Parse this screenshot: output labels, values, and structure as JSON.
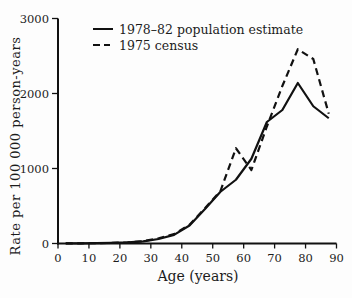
{
  "chart_data": {
    "type": "line",
    "title": "",
    "xlabel": "Age (years)",
    "ylabel": "Rate per 100 000 person-years",
    "xlim": [
      0,
      90
    ],
    "ylim": [
      0,
      3000
    ],
    "x_ticks": [
      0,
      10,
      20,
      30,
      40,
      50,
      60,
      70,
      80,
      90
    ],
    "y_ticks": [
      0,
      1000,
      2000,
      3000
    ],
    "grid": false,
    "legend_position": "top-left-inside",
    "line_color": "#111111",
    "x": [
      2.5,
      7.5,
      12.5,
      17.5,
      22.5,
      27.5,
      32.5,
      37.5,
      42.5,
      47.5,
      52.5,
      57.5,
      62.5,
      67.5,
      72.5,
      77.5,
      82.5,
      87.5
    ],
    "series": [
      {
        "name": "1978–82 population estimate",
        "style": "solid",
        "values": [
          3,
          3,
          4,
          8,
          14,
          28,
          60,
          115,
          240,
          460,
          690,
          850,
          1130,
          1620,
          1780,
          2140,
          1830,
          1670
        ]
      },
      {
        "name": "1975 census",
        "style": "dashed",
        "values": [
          3,
          3,
          4,
          8,
          14,
          30,
          70,
          125,
          250,
          470,
          700,
          1270,
          980,
          1560,
          2100,
          2590,
          2460,
          1730
        ]
      }
    ]
  }
}
